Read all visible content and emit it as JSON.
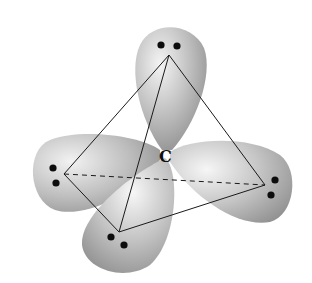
{
  "diagram": {
    "center_label": "C",
    "colors": {
      "lobe_light": "#f2f2f2",
      "lobe_mid": "#bdbdbd",
      "lobe_dark": "#8a8a8a",
      "edge": "#1a1a1a",
      "dot": "#0d0d0d",
      "background": "#ffffff"
    },
    "vertices": [
      {
        "name": "top",
        "x": 169,
        "y": 55
      },
      {
        "name": "left",
        "x": 64,
        "y": 174
      },
      {
        "name": "right",
        "x": 265,
        "y": 185
      },
      {
        "name": "bottom",
        "x": 119,
        "y": 232
      }
    ],
    "electron_pairs": [
      {
        "lobe": "top",
        "dots": [
          [
            161,
            45
          ],
          [
            177,
            46
          ]
        ]
      },
      {
        "lobe": "left",
        "dots": [
          [
            53,
            168
          ],
          [
            56,
            183
          ]
        ]
      },
      {
        "lobe": "right",
        "dots": [
          [
            275,
            180
          ],
          [
            271,
            195
          ]
        ]
      },
      {
        "lobe": "bottom",
        "dots": [
          [
            111,
            237
          ],
          [
            124,
            245
          ]
        ]
      }
    ]
  }
}
